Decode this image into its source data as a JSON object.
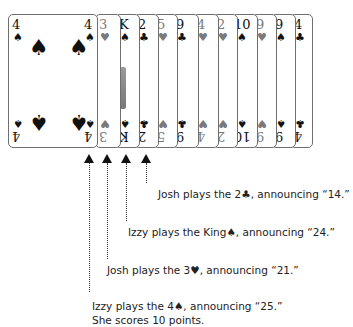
{
  "cards": [
    {
      "rank": "4",
      "suit": "♠",
      "color": "black",
      "left": 8,
      "width": 90
    },
    {
      "rank": "3",
      "suit": "♥",
      "color": "red",
      "left": 95,
      "width": 22
    },
    {
      "rank": "K",
      "suit": "♠",
      "color": "black",
      "left": 115,
      "width": 21
    },
    {
      "rank": "2",
      "suit": "♣",
      "color": "black",
      "left": 134,
      "width": 21
    },
    {
      "rank": "5",
      "suit": "♥",
      "color": "red",
      "left": 153,
      "width": 21
    },
    {
      "rank": "9",
      "suit": "♣",
      "color": "black",
      "left": 172,
      "width": 23
    },
    {
      "rank": "4",
      "suit": "♥",
      "color": "red",
      "left": 193,
      "width": 22
    },
    {
      "rank": "2",
      "suit": "♥",
      "color": "red",
      "left": 213,
      "width": 21
    },
    {
      "rank": "10",
      "suit": "♠",
      "color": "black",
      "left": 232,
      "width": 22
    },
    {
      "rank": "9",
      "suit": "♥",
      "color": "red",
      "left": 252,
      "width": 21
    },
    {
      "rank": "9",
      "suit": "♠",
      "color": "black",
      "left": 271,
      "width": 21
    },
    {
      "rank": "4",
      "suit": "♣",
      "color": "black",
      "left": 290,
      "width": 23
    }
  ],
  "annotations": [
    {
      "text": "Josh plays the 2♣, announcing “14.”",
      "arrow_x": 146,
      "line_end": 183,
      "text_x": 158,
      "text_y": 188
    },
    {
      "text": "Izzy plays the King♠, announcing “24.”",
      "arrow_x": 126,
      "line_end": 221,
      "text_x": 128,
      "text_y": 226
    },
    {
      "text": "Josh plays the 3♥, announcing “21.”",
      "arrow_x": 107,
      "line_end": 259,
      "text_x": 107,
      "text_y": 264
    },
    {
      "text": "Izzy plays the 4♠, announcing “25.”",
      "arrow_x": 89,
      "line_end": 292,
      "text_x": 92,
      "text_y": 300
    }
  ],
  "score_note": "She scores 10 points."
}
